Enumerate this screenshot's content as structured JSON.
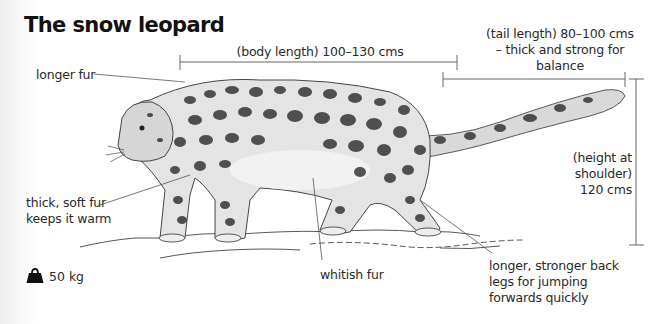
{
  "title": "The snow leopard",
  "measurements": {
    "body_length": "(body length) 100–130 cms",
    "tail_length": [
      "(tail length) 80–100 cms",
      "– thick and strong for",
      "balance"
    ],
    "height": [
      "(height at",
      "shoulder)",
      "120 cms"
    ]
  },
  "annotations": {
    "longer_fur": "longer fur",
    "thick_fur": [
      "thick, soft fur",
      "keeps it warm"
    ],
    "whitish_fur": "whitish fur",
    "back_legs": [
      "longer, stronger back",
      "legs for jumping",
      "forwards quickly"
    ]
  },
  "weight": {
    "icon": "weight-icon",
    "value": "50 kg"
  },
  "colors": {
    "text": "#2a2a2a",
    "lines": "#666666",
    "spots": "#2b2b2b"
  }
}
